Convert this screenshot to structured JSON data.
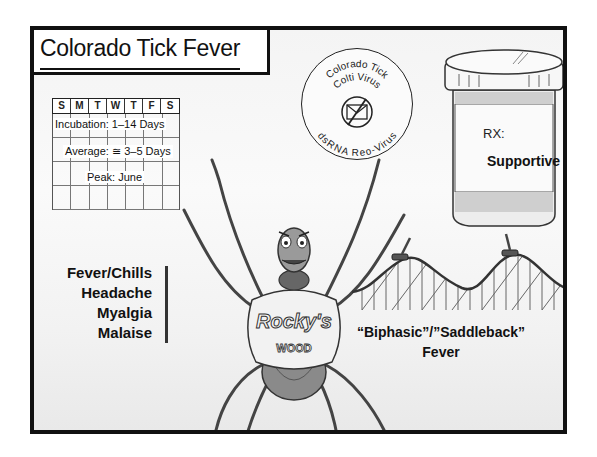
{
  "title": "Colorado Tick Fever",
  "calendar": {
    "days": [
      "S",
      "M",
      "T",
      "W",
      "T",
      "F",
      "S"
    ],
    "incubation": "Incubation: 1–14 Days",
    "average": "Average: ≅ 3–5 Days",
    "peak": "Peak: June"
  },
  "virus": {
    "line1": "Colorado Tick",
    "line2": "Colti Virus",
    "line3": "dsRNA Reo-Virus",
    "icon": "crossed-out-envelope-icon"
  },
  "treatment": {
    "rx_label": "RX:",
    "value": "Supportive"
  },
  "symptoms": {
    "items": [
      "Fever/Chills",
      "Headache",
      "Myalgia",
      "Malaise"
    ]
  },
  "fever_pattern": {
    "line1": "“Biphasic”/”Saddleback”",
    "line2": "Fever"
  },
  "character": {
    "shirt_line1": "Rocky's",
    "shirt_line2": "WOOD"
  },
  "colors": {
    "ink": "#111111",
    "background": "#f4f4f4"
  }
}
